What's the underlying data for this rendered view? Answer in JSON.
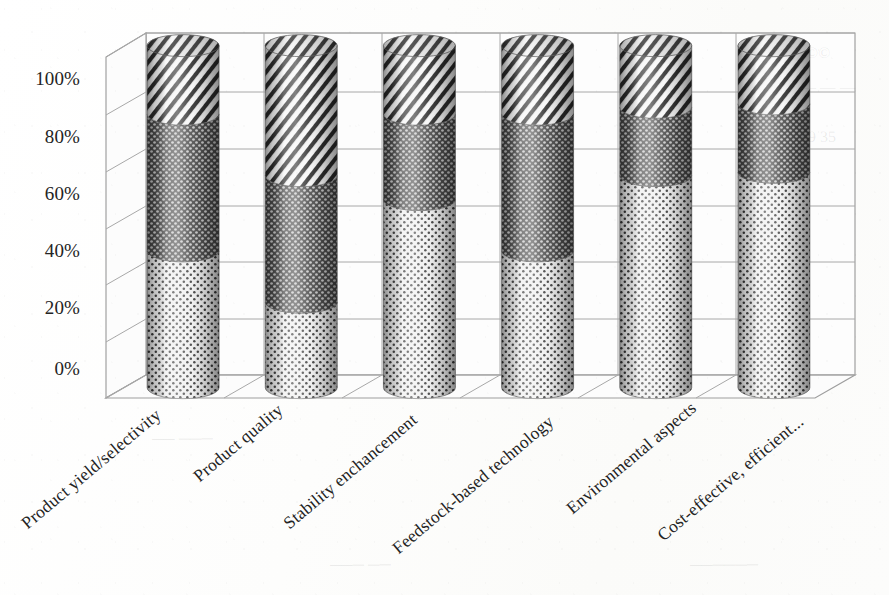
{
  "chart_data": {
    "type": "bar",
    "subtype": "3d-stacked-cylinder-100-percent",
    "title": "",
    "xlabel": "",
    "ylabel": "",
    "ylim": [
      0,
      100
    ],
    "yticks": [
      "0%",
      "20%",
      "40%",
      "60%",
      "80%",
      "100%"
    ],
    "ytick_values": [
      0,
      20,
      40,
      60,
      80,
      100
    ],
    "grid": true,
    "legend": "none",
    "categories": [
      "Product yield/selectivity",
      "Product quality",
      "Stability enchancement",
      "Feedstock-based technology",
      "Environmental aspects",
      "Cost-effective, efficient..."
    ],
    "series": [
      {
        "name": "Series 1",
        "pattern": "light-dotted",
        "values": [
          40,
          25,
          55,
          40,
          62,
          63
        ]
      },
      {
        "name": "Series 2",
        "pattern": "dark-crosshatch",
        "values": [
          40,
          37,
          25,
          40,
          20,
          20
        ]
      },
      {
        "name": "Series 3",
        "pattern": "diagonal-stripes",
        "values": [
          20,
          38,
          20,
          20,
          18,
          17
        ]
      }
    ]
  },
  "colors": {
    "axis_line": "#9a9a9a",
    "grid_line": "#a8a8a8",
    "tick_text": "#242424",
    "series_light": "#ececec",
    "series_dark": "#4a4a4a",
    "series_stripe": "#2e2e2e",
    "background": "#ffffff"
  },
  "bleed_text": {
    "line1": "©©",
    "line2": "— — —",
    "line3": "69 35",
    "line4": "──  ───",
    "line5": "──────",
    "line6": "───  ──"
  }
}
